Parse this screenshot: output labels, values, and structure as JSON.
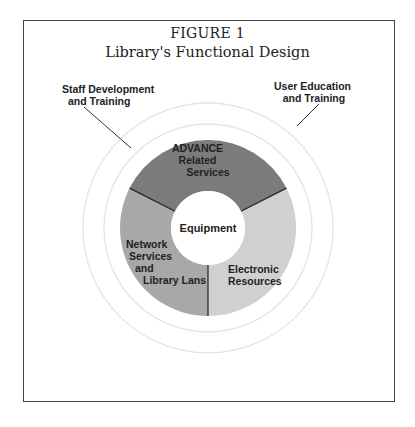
{
  "figure": {
    "number": "FIGURE 1",
    "title": "Library's Functional Design"
  },
  "outer_labels": {
    "left": [
      "Staff Development",
      "and Training"
    ],
    "right": [
      "User Education",
      "and Training"
    ]
  },
  "center": {
    "label": "Equipment"
  },
  "segments": [
    {
      "name": "advance",
      "lines": [
        "ADVANCE",
        "Related",
        "Services"
      ],
      "color": "#7d7d7d"
    },
    {
      "name": "electronic",
      "lines": [
        "Electronic",
        "Resources"
      ],
      "color": "#cfcfcf"
    },
    {
      "name": "network",
      "lines": [
        "Network",
        "Services",
        "and",
        "Library Lans"
      ],
      "color": "#a9a9a9"
    }
  ],
  "rings": {
    "color": "#e6e6e6"
  }
}
